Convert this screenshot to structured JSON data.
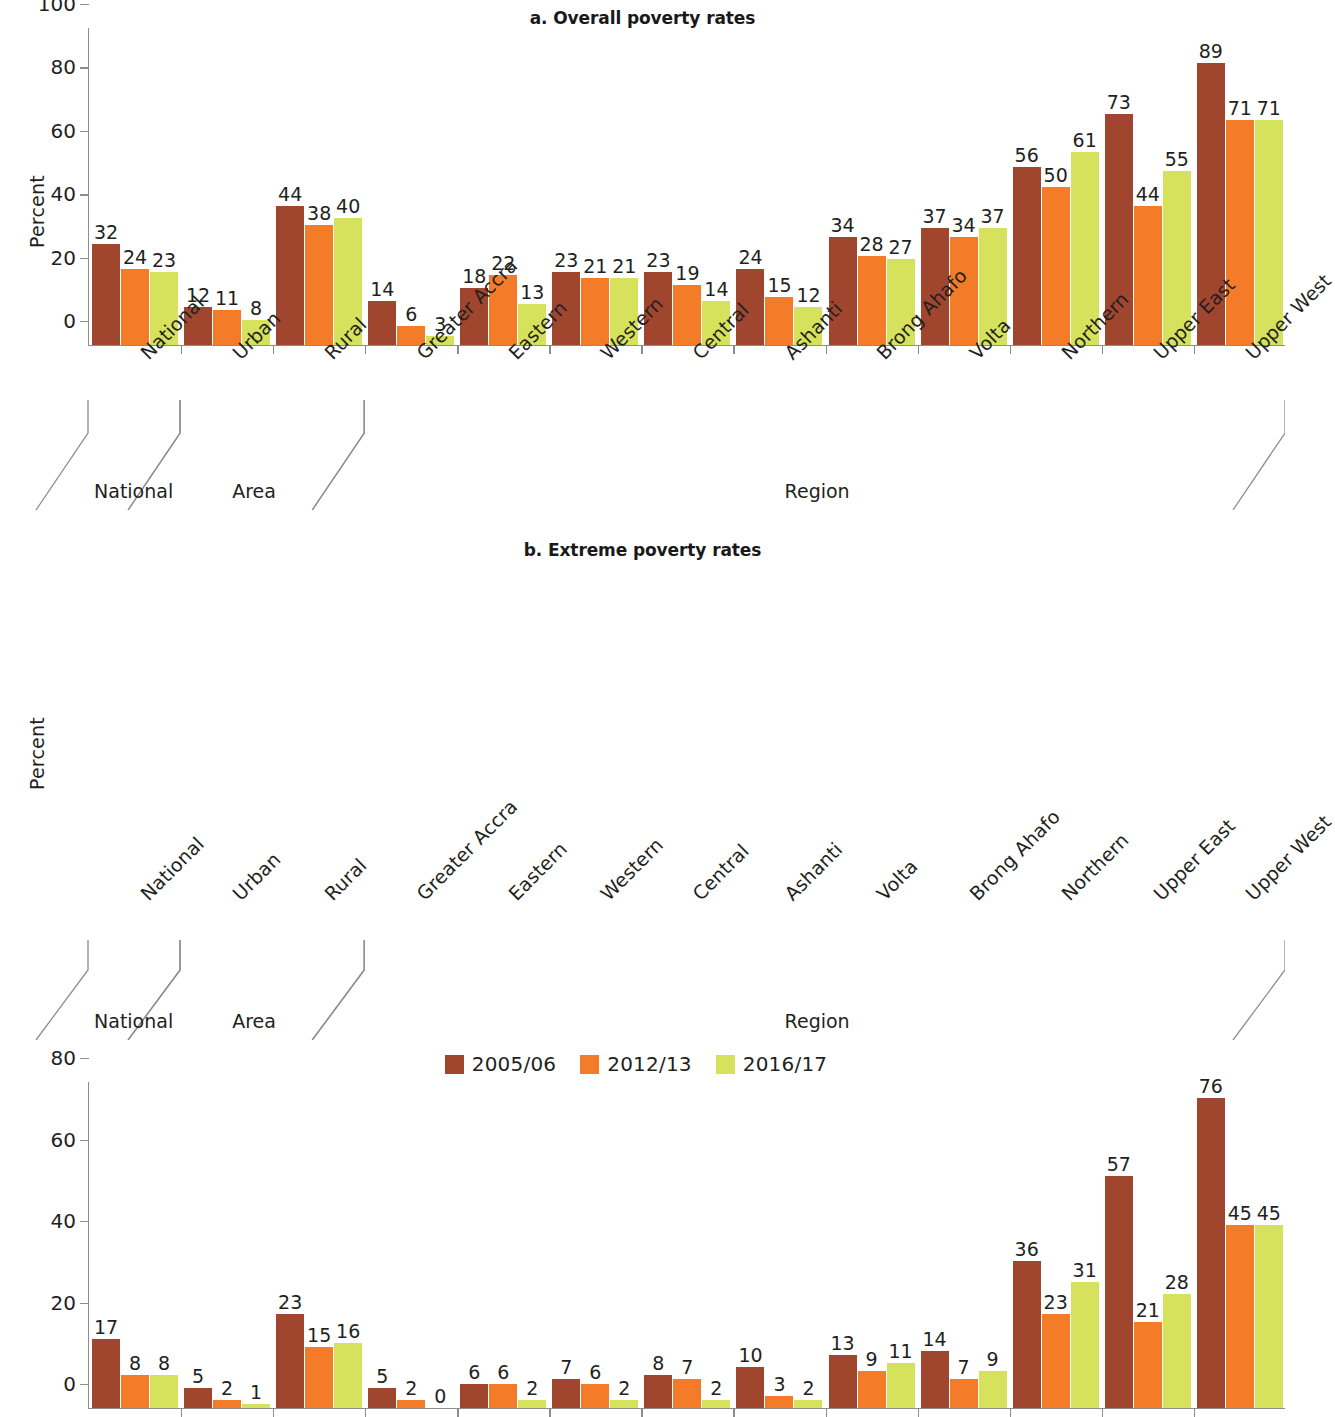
{
  "figure": {
    "ylabel": "Percent"
  },
  "legend": {
    "items": [
      {
        "label": "2005/06",
        "color": "#a0462f"
      },
      {
        "label": "2012/13",
        "color": "#f47b28"
      },
      {
        "label": "2016/17",
        "color": "#d6e25c"
      }
    ]
  },
  "bracket_labels": {
    "national": "National",
    "area": "Area",
    "region": "Region"
  },
  "chart_data": [
    {
      "type": "bar",
      "panel": "a",
      "title": "a. Overall poverty rates",
      "xlabel": "",
      "ylabel": "Percent",
      "ylim": [
        0,
        100
      ],
      "yticks": [
        0,
        20,
        40,
        60,
        80,
        100
      ],
      "grid": false,
      "legend_position": "bottom-center",
      "categories": [
        "National",
        "Urban",
        "Rural",
        "Greater Accra",
        "Eastern",
        "Western",
        "Central",
        "Ashanti",
        "Brong Ahafo",
        "Volta",
        "Northern",
        "Upper East",
        "Upper West"
      ],
      "groups": [
        {
          "name": "National",
          "members": [
            "National"
          ]
        },
        {
          "name": "Area",
          "members": [
            "Urban",
            "Rural"
          ]
        },
        {
          "name": "Region",
          "members": [
            "Greater Accra",
            "Eastern",
            "Western",
            "Central",
            "Ashanti",
            "Brong Ahafo",
            "Volta",
            "Northern",
            "Upper East",
            "Upper West"
          ]
        }
      ],
      "series": [
        {
          "name": "2005/06",
          "color": "#a0462f",
          "values": [
            32,
            12,
            44,
            14,
            18,
            23,
            23,
            24,
            34,
            37,
            56,
            73,
            89
          ]
        },
        {
          "name": "2012/13",
          "color": "#f47b28",
          "values": [
            24,
            11,
            38,
            6,
            22,
            21,
            19,
            15,
            28,
            34,
            50,
            44,
            71
          ]
        },
        {
          "name": "2016/17",
          "color": "#d6e25c",
          "values": [
            23,
            8,
            40,
            3,
            13,
            21,
            14,
            12,
            27,
            37,
            61,
            55,
            71
          ]
        }
      ]
    },
    {
      "type": "bar",
      "panel": "b",
      "title": "b. Extreme poverty rates",
      "xlabel": "",
      "ylabel": "Percent",
      "ylim": [
        0,
        80
      ],
      "yticks": [
        0,
        20,
        40,
        60,
        80
      ],
      "grid": false,
      "legend_position": "bottom-center",
      "categories": [
        "National",
        "Urban",
        "Rural",
        "Greater Accra",
        "Eastern",
        "Western",
        "Central",
        "Ashanti",
        "Volta",
        "Brong Ahafo",
        "Northern",
        "Upper East",
        "Upper West"
      ],
      "groups": [
        {
          "name": "National",
          "members": [
            "National"
          ]
        },
        {
          "name": "Area",
          "members": [
            "Urban",
            "Rural"
          ]
        },
        {
          "name": "Region",
          "members": [
            "Greater Accra",
            "Eastern",
            "Western",
            "Central",
            "Ashanti",
            "Volta",
            "Brong Ahafo",
            "Northern",
            "Upper East",
            "Upper West"
          ]
        }
      ],
      "series": [
        {
          "name": "2005/06",
          "color": "#a0462f",
          "values": [
            17,
            5,
            23,
            5,
            6,
            7,
            8,
            10,
            13,
            14,
            36,
            57,
            76
          ]
        },
        {
          "name": "2012/13",
          "color": "#f47b28",
          "values": [
            8,
            2,
            15,
            2,
            6,
            6,
            7,
            3,
            9,
            7,
            23,
            21,
            45
          ]
        },
        {
          "name": "2016/17",
          "color": "#d6e25c",
          "values": [
            8,
            1,
            16,
            0,
            2,
            2,
            2,
            2,
            11,
            9,
            31,
            28,
            45
          ]
        }
      ]
    }
  ]
}
